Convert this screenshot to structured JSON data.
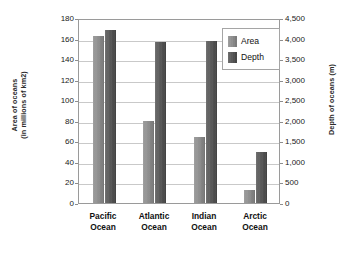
{
  "chart_data": {
    "type": "bar",
    "title": "",
    "categories": [
      "Pacific Ocean",
      "Atlantic Ocean",
      "Indian Ocean",
      "Arctic Ocean"
    ],
    "category_lines": [
      [
        "Pacific",
        "Ocean"
      ],
      [
        "Atlantic",
        "Ocean"
      ],
      [
        "Indian",
        "Ocean"
      ],
      [
        "Arctic",
        "Ocean"
      ]
    ],
    "series": [
      {
        "name": "Area",
        "axis": "left",
        "units": "millions of km2",
        "color": "#8a8a8a",
        "values": [
          162,
          80,
          64,
          13
        ]
      },
      {
        "name": "Depth",
        "axis": "right",
        "units": "m",
        "color": "#525252",
        "values": [
          4200,
          3925,
          3950,
          1250
        ]
      }
    ],
    "xlabel": "",
    "ylabel": "Area of oceans (in millions of km2)",
    "ylabel_lines": [
      "Area of oceans",
      "(in millions of km2)"
    ],
    "y2label": "Depth of oceans (m)",
    "ylim": [
      0,
      180
    ],
    "y2lim": [
      0,
      4500
    ],
    "yticks": [
      0,
      20,
      40,
      60,
      80,
      100,
      120,
      140,
      160,
      180
    ],
    "ytick_labels": [
      "0",
      "20",
      "40",
      "60",
      "80",
      "100",
      "120",
      "140",
      "160",
      "180"
    ],
    "y2ticks": [
      0,
      500,
      1000,
      1500,
      2000,
      2500,
      3000,
      3500,
      4000,
      4500
    ],
    "y2tick_labels": [
      "0",
      "500",
      "1,000",
      "1,500",
      "2,000",
      "2,500",
      "3,000",
      "3,500",
      "4,000",
      "4,500"
    ],
    "grid": true,
    "legend_position": "top-right",
    "legend_entries": [
      "Area",
      "Depth"
    ],
    "background_color": "#ffffff",
    "grid_color": "#c9c9c9",
    "frame_color": "#9a9a9a"
  }
}
